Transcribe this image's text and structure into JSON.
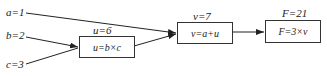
{
  "inputs": [
    {
      "id": "a",
      "label": "a=1"
    },
    {
      "id": "b",
      "label": "b=2"
    },
    {
      "id": "c",
      "label": "c=3"
    }
  ],
  "nodes": [
    {
      "id": "u",
      "value_label": "u=6",
      "formula": "u=b×c"
    },
    {
      "id": "v",
      "value_label": "v=7",
      "formula": "v=a+u"
    },
    {
      "id": "F",
      "value_label": "F=21",
      "formula": "F=3×v"
    }
  ],
  "edges": [
    {
      "from": "a",
      "to": "v"
    },
    {
      "from": "b",
      "to": "u"
    },
    {
      "from": "c",
      "to": "u"
    },
    {
      "from": "u",
      "to": "v"
    },
    {
      "from": "v",
      "to": "F"
    }
  ],
  "colors": {
    "stroke": "#222222",
    "text": "#222222",
    "background": "#ffffff"
  }
}
